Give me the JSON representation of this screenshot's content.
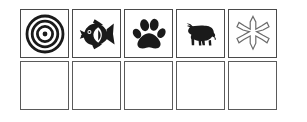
{
  "grid": {
    "columns": 5,
    "rows": 2,
    "background_color": "#ffffff",
    "cell_border_color": "#4a4a4a",
    "icon_color": "#1a1a1a",
    "rows_data": [
      {
        "row_name": "icon-row",
        "cells": [
          {
            "icon": "bullseye-target-icon",
            "label": "Target",
            "filled": "true"
          },
          {
            "icon": "tropical-fish-icon",
            "label": "Fish",
            "filled": "true"
          },
          {
            "icon": "paw-print-icon",
            "label": "Paw Print",
            "filled": "true"
          },
          {
            "icon": "cow-icon",
            "label": "Cow",
            "filled": "true"
          },
          {
            "icon": "asterisk-star-icon",
            "label": "Asterisk",
            "filled": "true"
          }
        ]
      },
      {
        "row_name": "empty-row",
        "cells": [
          {
            "icon": "",
            "label": "",
            "filled": "false"
          },
          {
            "icon": "",
            "label": "",
            "filled": "false"
          },
          {
            "icon": "",
            "label": "",
            "filled": "false"
          },
          {
            "icon": "",
            "label": "",
            "filled": "false"
          },
          {
            "icon": "",
            "label": "",
            "filled": "false"
          }
        ]
      }
    ]
  }
}
